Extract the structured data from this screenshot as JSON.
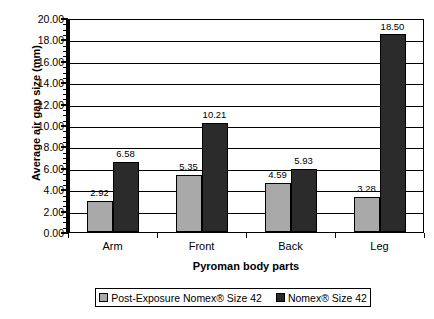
{
  "chart_data": {
    "type": "bar",
    "title": "",
    "xlabel": "Pyroman body parts",
    "ylabel": "Average air gap size (mm)",
    "categories": [
      "Arm",
      "Front",
      "Back",
      "Leg"
    ],
    "series": [
      {
        "name": "Post-Exposure Nomex®  Size 42",
        "color": "#a9a9a9",
        "values": [
          2.92,
          5.35,
          4.59,
          3.28
        ],
        "labels": [
          "2.92",
          "5.35",
          "4.59",
          "3.28"
        ]
      },
      {
        "name": "Nomex® Size 42",
        "color": "#2b2b2b",
        "values": [
          6.58,
          10.21,
          5.93,
          18.5
        ],
        "labels": [
          "6.58",
          "10.21",
          "5.93",
          "18.50"
        ]
      }
    ],
    "ylim": [
      0,
      20
    ],
    "ytick_step": 2,
    "ytick_labels": [
      "20.00",
      "18.00",
      "16.00",
      "14.00",
      "12.00",
      "10.00",
      "8.00",
      "6.00",
      "4.00",
      "2.00",
      "0.00"
    ],
    "grid": "horizontal",
    "legend_position": "bottom"
  },
  "axes": {
    "y_title": "Average air gap size (mm)",
    "x_title": "Pyroman body parts"
  },
  "legend": {
    "entries": [
      {
        "label": "Post-Exposure Nomex®  Size 42",
        "color": "#a9a9a9"
      },
      {
        "label": "Nomex® Size 42",
        "color": "#2b2b2b"
      }
    ]
  },
  "cropped_header": ""
}
